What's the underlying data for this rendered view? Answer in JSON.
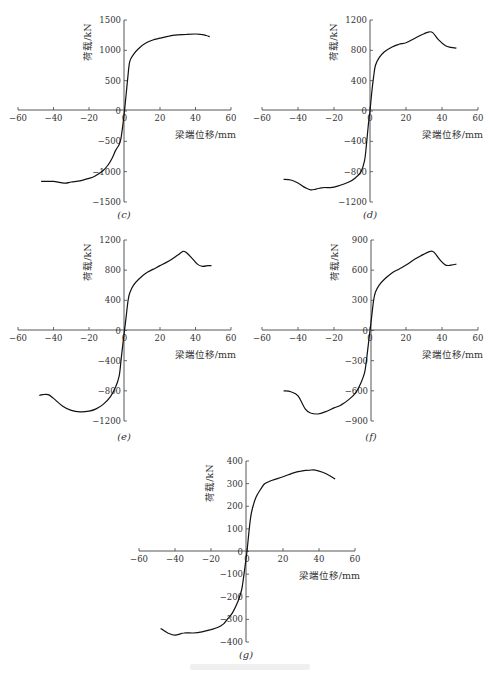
{
  "figure": {
    "caption_visible_text": ""
  },
  "chart_data": [
    {
      "panel": "(c)",
      "type": "line",
      "xlabel": "梁端位移/mm",
      "ylabel": "荷载/kN",
      "xlim": [
        -60,
        60
      ],
      "ylim": [
        -1500,
        1500
      ],
      "xticks": [
        -60,
        -40,
        -20,
        0,
        20,
        40,
        60
      ],
      "yticks": [
        -1500,
        -1000,
        -500,
        0,
        500,
        1000,
        1500
      ],
      "series": [
        {
          "name": "positive",
          "x": [
            0,
            1,
            2,
            3,
            5,
            8,
            12,
            16,
            20,
            25,
            30,
            35,
            40,
            43,
            46,
            48
          ],
          "y": [
            0,
            300,
            600,
            820,
            930,
            1030,
            1120,
            1170,
            1200,
            1235,
            1255,
            1265,
            1270,
            1265,
            1245,
            1225
          ]
        },
        {
          "name": "negative",
          "x": [
            0,
            -1,
            -2,
            -3,
            -5,
            -7,
            -9,
            -12,
            -17,
            -20,
            -25,
            -30,
            -33,
            -36,
            -40,
            -44,
            -47
          ],
          "y": [
            0,
            -250,
            -450,
            -550,
            -650,
            -780,
            -880,
            -980,
            -1080,
            -1110,
            -1150,
            -1170,
            -1190,
            -1180,
            -1160,
            -1160,
            -1160
          ]
        }
      ]
    },
    {
      "panel": "(d)",
      "type": "line",
      "xlabel": "梁端位移/mm",
      "ylabel": "荷载/kN",
      "xlim": [
        -60,
        60
      ],
      "ylim": [
        -1200,
        1200
      ],
      "xticks": [
        -60,
        -40,
        -20,
        0,
        20,
        40,
        60
      ],
      "yticks": [
        -1200,
        -800,
        -400,
        0,
        400,
        800,
        1200
      ],
      "series": [
        {
          "name": "positive",
          "x": [
            0,
            1,
            2,
            3,
            5,
            8,
            12,
            16,
            20,
            25,
            30,
            33,
            35,
            38,
            42,
            45,
            48
          ],
          "y": [
            0,
            250,
            450,
            600,
            700,
            780,
            840,
            880,
            900,
            960,
            1020,
            1045,
            1030,
            940,
            860,
            840,
            830
          ]
        },
        {
          "name": "negative",
          "x": [
            0,
            -1,
            -2,
            -3,
            -5,
            -8,
            -12,
            -18,
            -22,
            -26,
            -30,
            -33,
            -36,
            -40,
            -44,
            -48
          ],
          "y": [
            0,
            -200,
            -450,
            -650,
            -800,
            -880,
            -940,
            -990,
            -1010,
            -1010,
            -1030,
            -1040,
            -1010,
            -950,
            -910,
            -900
          ]
        }
      ]
    },
    {
      "panel": "(e)",
      "type": "line",
      "xlabel": "梁端位移/mm",
      "ylabel": "荷载/kN",
      "xlim": [
        -60,
        60
      ],
      "ylim": [
        -1200,
        1200
      ],
      "xticks": [
        -60,
        -40,
        -20,
        0,
        20,
        40,
        60
      ],
      "yticks": [
        -1200,
        -800,
        -400,
        0,
        400,
        800,
        1200
      ],
      "series": [
        {
          "name": "positive",
          "x": [
            0,
            1,
            2,
            3,
            5,
            8,
            12,
            16,
            20,
            25,
            30,
            33,
            35,
            38,
            41,
            44,
            47,
            49
          ],
          "y": [
            0,
            200,
            400,
            500,
            600,
            680,
            760,
            810,
            860,
            920,
            1000,
            1050,
            1030,
            960,
            880,
            850,
            860,
            860
          ]
        },
        {
          "name": "negative",
          "x": [
            0,
            -1,
            -2,
            -3,
            -5,
            -8,
            -12,
            -16,
            -20,
            -25,
            -30,
            -35,
            -40,
            -43,
            -46,
            -48
          ],
          "y": [
            0,
            -200,
            -400,
            -600,
            -750,
            -880,
            -980,
            -1040,
            -1070,
            -1080,
            -1060,
            -1000,
            -900,
            -850,
            -850,
            -860
          ]
        }
      ]
    },
    {
      "panel": "(f)",
      "type": "line",
      "xlabel": "梁端位移/mm",
      "ylabel": "荷载/kN",
      "xlim": [
        -60,
        60
      ],
      "ylim": [
        -900,
        900
      ],
      "xticks": [
        -60,
        -40,
        -20,
        0,
        20,
        40,
        60
      ],
      "yticks": [
        -900,
        -600,
        -300,
        0,
        300,
        600,
        900
      ],
      "series": [
        {
          "name": "positive",
          "x": [
            0,
            1,
            2,
            3,
            5,
            8,
            12,
            16,
            20,
            25,
            30,
            34,
            36,
            39,
            42,
            45,
            48
          ],
          "y": [
            0,
            150,
            300,
            380,
            450,
            510,
            570,
            610,
            650,
            710,
            760,
            790,
            770,
            700,
            650,
            650,
            660
          ]
        },
        {
          "name": "negative",
          "x": [
            0,
            -1,
            -2,
            -3,
            -5,
            -8,
            -12,
            -16,
            -20,
            -25,
            -29,
            -33,
            -36,
            -40,
            -44,
            -48
          ],
          "y": [
            0,
            -150,
            -300,
            -420,
            -520,
            -620,
            -690,
            -740,
            -770,
            -810,
            -830,
            -820,
            -780,
            -650,
            -610,
            -600
          ]
        }
      ]
    },
    {
      "panel": "(g)",
      "type": "line",
      "xlabel": "梁端位移/mm",
      "ylabel": "荷载/kN",
      "xlim": [
        -60,
        60
      ],
      "ylim": [
        -400,
        400
      ],
      "xticks": [
        -60,
        -40,
        -20,
        0,
        20,
        40,
        60
      ],
      "yticks": [
        -400,
        -300,
        -200,
        -100,
        0,
        100,
        200,
        300,
        400
      ],
      "series": [
        {
          "name": "positive",
          "x": [
            0,
            1,
            2,
            3,
            5,
            8,
            10,
            14,
            20,
            25,
            30,
            35,
            38,
            42,
            46,
            49
          ],
          "y": [
            0,
            80,
            150,
            190,
            240,
            280,
            300,
            315,
            330,
            345,
            355,
            360,
            360,
            350,
            335,
            320
          ]
        },
        {
          "name": "negative",
          "x": [
            0,
            -1,
            -2,
            -3,
            -5,
            -8,
            -11,
            -13,
            -16,
            -20,
            -25,
            -30,
            -35,
            -40,
            -44,
            -48
          ],
          "y": [
            0,
            -60,
            -120,
            -170,
            -220,
            -270,
            -300,
            -320,
            -335,
            -345,
            -355,
            -360,
            -360,
            -370,
            -360,
            -340
          ]
        }
      ]
    }
  ],
  "panels": {
    "c": {
      "label": "(c)",
      "xlabel": "梁端位移/mm",
      "ylabel": "荷载/kN",
      "yticks": [
        "1500",
        "1000",
        "500",
        "0",
        "-500",
        "-1000",
        "-1500"
      ]
    },
    "d": {
      "label": "(d)",
      "xlabel": "梁端位移/mm",
      "ylabel": "荷载/kN",
      "yticks": [
        "1200",
        "800",
        "400",
        "0",
        "-400",
        "-800",
        "-1200"
      ]
    },
    "e": {
      "label": "(e)",
      "xlabel": "梁端位移/mm",
      "ylabel": "荷载/kN",
      "yticks": [
        "1200",
        "800",
        "400",
        "0",
        "-400",
        "-800",
        "-1200"
      ]
    },
    "f": {
      "label": "(f)",
      "xlabel": "梁端位移/mm",
      "ylabel": "荷载/kN",
      "yticks": [
        "900",
        "600",
        "300",
        "0",
        "-300",
        "-600",
        "-900"
      ]
    },
    "g": {
      "label": "(g)",
      "xlabel": "梁端位移/mm",
      "ylabel": "荷载/kN",
      "yticks": [
        "400",
        "300",
        "200",
        "100",
        "0",
        "-100",
        "-200",
        "-300",
        "-400"
      ]
    },
    "xticks": [
      "-60",
      "-40",
      "-20",
      "0",
      "20",
      "40",
      "60"
    ]
  }
}
